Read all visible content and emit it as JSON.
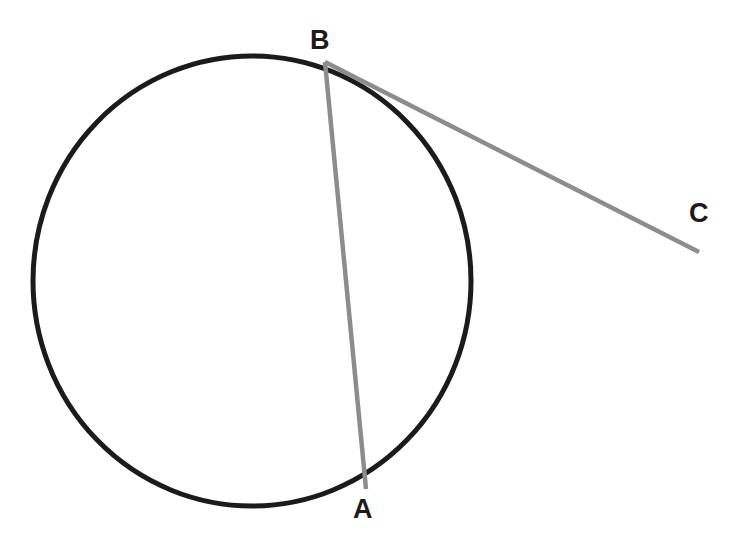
{
  "figure": {
    "background_color": "#ffffff",
    "width": 729,
    "height": 544
  },
  "labels": {
    "a": "A",
    "b": "B",
    "c": "C"
  },
  "colors": {
    "circle_stroke": "#1b1b1b",
    "chord_stroke": "#8c8c8c",
    "tangent_stroke": "#8c8c8c",
    "label_text": "#1b1b1b",
    "background": "#ffffff"
  },
  "chart_data": {
    "type": "diagram",
    "shapes": [
      {
        "name": "circle",
        "kind": "ellipse",
        "cx": 252,
        "cy": 281,
        "rx": 219,
        "ry": 225,
        "stroke": "#1b1b1b",
        "stroke_width": 5,
        "fill": "none"
      },
      {
        "name": "chord-ba",
        "kind": "line",
        "x1": 325,
        "y1": 62,
        "x2": 366,
        "y2": 489,
        "stroke": "#8c8c8c",
        "stroke_width": 4.5
      },
      {
        "name": "tangent-bc",
        "kind": "line",
        "x1": 325,
        "y1": 62,
        "x2": 699,
        "y2": 252,
        "stroke": "#8c8c8c",
        "stroke_width": 4.5
      }
    ],
    "points": [
      {
        "label": "B",
        "x": 325,
        "y": 62,
        "label_x": 322,
        "label_y": 40
      },
      {
        "label": "A",
        "x": 366,
        "y": 489,
        "label_x": 365,
        "label_y": 509
      },
      {
        "label": "C",
        "x": 699,
        "y": 252,
        "label_x": 701,
        "label_y": 213
      }
    ],
    "annotations": [
      "B and A lie on the circle; BA is a chord",
      "BC is a line from B passing outside the circle to external point C"
    ]
  }
}
